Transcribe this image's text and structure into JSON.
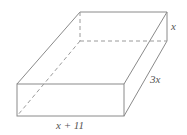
{
  "diagram": {
    "type": "rectangular-prism",
    "labels": {
      "height": "x",
      "depth": "3x",
      "width": "x + 11"
    },
    "colors": {
      "edge": "#8a8a8a",
      "label": "#555555"
    }
  }
}
